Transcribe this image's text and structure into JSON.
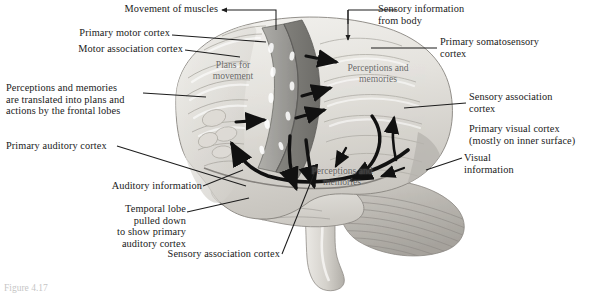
{
  "figure": {
    "caption": "Figure 4.17",
    "colors": {
      "background": "#ffffff",
      "text": "#1a1a1a",
      "leader_line": "#1d1d1d",
      "flow_arrow": "#111111",
      "cortex_light": "#e8e6e2",
      "cortex_mid": "#cfccc6",
      "motor_strip": "#9a9a96",
      "somatosensory_strip": "#7e7e7b",
      "cerebellum": "#b9b7b2",
      "brainstem": "#d6d4cf",
      "surface_label": "#4c4c4c"
    }
  },
  "callouts": [
    {
      "id": "movement-of-muscles",
      "text": "Movement of muscles",
      "align": "right"
    },
    {
      "id": "primary-motor-cortex",
      "text": "Primary motor cortex",
      "align": "right"
    },
    {
      "id": "motor-association-cortex",
      "text": "Motor association cortex",
      "align": "right"
    },
    {
      "id": "frontal-lobes-translation",
      "text": "Perceptions and memories\nare translated into plans and\nactions by the frontal lobes",
      "align": "left"
    },
    {
      "id": "primary-auditory-cortex",
      "text": "Primary auditory cortex",
      "align": "left"
    },
    {
      "id": "auditory-information",
      "text": "Auditory information",
      "align": "right"
    },
    {
      "id": "temporal-lobe-pulled-down",
      "text": "Temporal lobe\npulled down\nto show primary\nauditory cortex",
      "align": "right"
    },
    {
      "id": "sensory-association-cortex-bottom",
      "text": "Sensory association cortex",
      "align": "right"
    },
    {
      "id": "sensory-information-from-body",
      "text": "Sensory information\nfrom body",
      "align": "left"
    },
    {
      "id": "primary-somatosensory-cortex",
      "text": "Primary somatosensory\ncortex",
      "align": "left"
    },
    {
      "id": "sensory-association-cortex-right",
      "text": "Sensory association\ncortex",
      "align": "left"
    },
    {
      "id": "primary-visual-cortex",
      "text": "Primary visual cortex\n(mostly on inner surface)",
      "align": "left"
    },
    {
      "id": "visual-information",
      "text": "Visual\ninformation",
      "align": "left"
    }
  ],
  "surface_labels": [
    {
      "id": "plans-for-movement",
      "text": "Plans for\nmovement"
    },
    {
      "id": "perceptions-memories-top",
      "text": "Perceptions and\nmemories"
    },
    {
      "id": "perceptions-memories-bottom",
      "text": "Perceptions and\nmemories"
    }
  ]
}
